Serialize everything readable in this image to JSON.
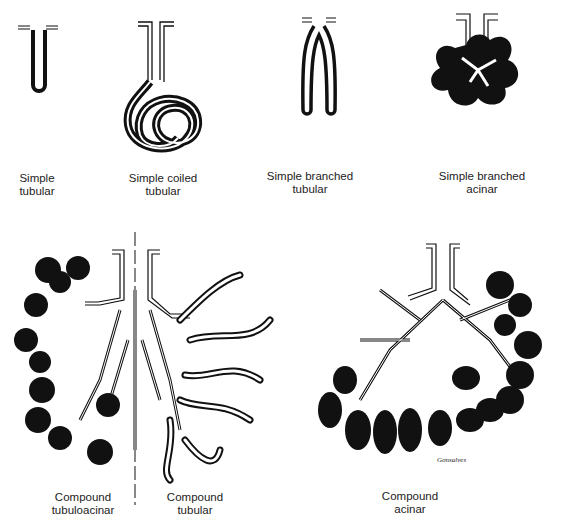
{
  "figure": {
    "panels": [
      {
        "id": "simple-tubular",
        "label": [
          "Simple",
          "tubular"
        ]
      },
      {
        "id": "simple-coiled-tubular",
        "label": [
          "Simple coiled",
          "tubular"
        ]
      },
      {
        "id": "simple-branched-tubular",
        "label": [
          "Simple branched",
          "tubular"
        ]
      },
      {
        "id": "simple-branched-acinar",
        "label": [
          "Simple branched",
          "acinar"
        ]
      },
      {
        "id": "compound-tubuloacinar",
        "label": [
          "Compound",
          "tubuloacinar"
        ]
      },
      {
        "id": "compound-tubular",
        "label": [
          "Compound",
          "tubular"
        ]
      },
      {
        "id": "compound-acinar",
        "label": [
          "Compound",
          "acinar"
        ]
      }
    ],
    "signature": "Gonsalves",
    "colors": {
      "ink": "#111111",
      "background": "#ffffff"
    }
  }
}
